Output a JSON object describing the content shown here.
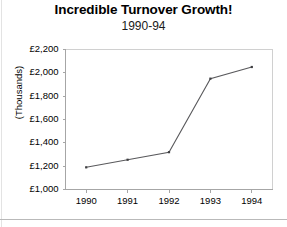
{
  "chart_data": {
    "type": "line",
    "title": "Incredible Turnover Growth!",
    "subtitle": "1990-94",
    "xlabel": "",
    "ylabel": "(Thousands)",
    "categories": [
      "1990",
      "1991",
      "1992",
      "1993",
      "1994"
    ],
    "values": [
      1190,
      1255,
      1320,
      1950,
      2050
    ],
    "series": [
      {
        "name": "Turnover",
        "values": [
          1190,
          1255,
          1320,
          1950,
          2050
        ]
      }
    ],
    "ylim": [
      1000,
      2200
    ],
    "yticks": [
      1000,
      1200,
      1400,
      1600,
      1800,
      2000,
      2200
    ],
    "ytick_labels": [
      "£1,000",
      "£1,200",
      "£1,400",
      "£1,600",
      "£1,800",
      "£2,000",
      "£2,200"
    ],
    "xtick_labels": [
      "1990",
      "1991",
      "1992",
      "1993",
      "1994"
    ],
    "grid": "horizontal-dotted",
    "legend": "none",
    "currency": "GBP",
    "units": "Thousands",
    "colors": {
      "line": "#59595c",
      "marker": "#3f3f42",
      "grid": "#d8d8d8",
      "axis": "#a6a6a6",
      "plot_border": "#d0d0d0",
      "background": "#ffffff",
      "text": "#000000"
    }
  }
}
